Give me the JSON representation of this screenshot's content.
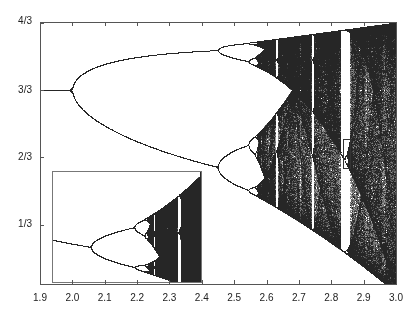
{
  "chart_data": {
    "type": "scatter",
    "title": "",
    "map": "y_next = y + r*y*(1-y)",
    "xlabel": "",
    "ylabel": "",
    "xlim": [
      1.9,
      3.0
    ],
    "ylim": [
      0.04,
      1.3333
    ],
    "x_ticks": [
      1.9,
      2.0,
      2.1,
      2.2,
      2.3,
      2.4,
      2.5,
      2.6,
      2.7,
      2.8,
      2.9,
      3.0
    ],
    "x_tick_labels": [
      "1.9",
      "2.0",
      "2.1",
      "2.2",
      "2.3",
      "2.4",
      "2.5",
      "2.6",
      "2.7",
      "2.8",
      "2.9",
      "3.0"
    ],
    "y_ticks": [
      0.3333,
      0.6667,
      1.0,
      1.3333
    ],
    "y_tick_labels": [
      "1/3",
      "2/3",
      "3/3",
      "4/3"
    ],
    "grid": false,
    "legend": null,
    "key_points": [
      {
        "r": 2.0,
        "y": 1.0,
        "event": "period-2 bifurcation"
      },
      {
        "r": 2.449,
        "event": "period-4 bifurcation"
      },
      {
        "r": 2.544,
        "event": "period-8 bifurcation"
      },
      {
        "r": 2.57,
        "event": "onset of chaos"
      },
      {
        "r": 2.83,
        "event": "period-3 window"
      },
      {
        "r": 3.0,
        "y_range": [
          0.0,
          1.3333
        ],
        "event": "full chaotic band"
      }
    ],
    "highlight_box": {
      "r_range": [
        2.836,
        2.857
      ],
      "y_range": [
        0.612,
        0.756
      ]
    },
    "inset": {
      "description": "Magnification of highlighted box showing self-similar bifurcation structure",
      "r_range": [
        2.836,
        2.857
      ],
      "y_range": [
        0.612,
        0.756
      ],
      "position_px": {
        "left": 52,
        "top": 171,
        "width": 149,
        "height": 111
      }
    }
  }
}
